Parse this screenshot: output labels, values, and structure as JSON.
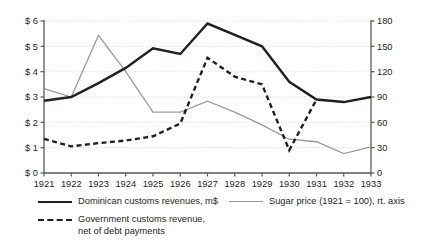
{
  "chart_data": {
    "type": "line",
    "title": "",
    "subtitle": "",
    "xlabel": "",
    "ylabel": "",
    "y2label": "",
    "grid": true,
    "legend_position": "bottom",
    "x": [
      "1921",
      "1922",
      "1923",
      "1924",
      "1925",
      "1926",
      "1927",
      "1928",
      "1929",
      "1930",
      "1931",
      "1932",
      "1933"
    ],
    "xtick_labels": [
      "1921",
      "1922",
      "1923",
      "1924",
      "1925",
      "1926",
      "1927",
      "1928",
      "1929",
      "1930",
      "1931",
      "1932",
      "1933"
    ],
    "ylim": [
      0,
      6
    ],
    "ytick_labels": [
      "$ 0",
      "$ 1",
      "$ 2",
      "$ 3",
      "$ 4",
      "$ 5",
      "$ 6"
    ],
    "ytick_values": [
      0,
      1,
      2,
      3,
      4,
      5,
      6
    ],
    "y2lim": [
      0,
      180
    ],
    "y2tick_labels": [
      "0",
      "30",
      "60",
      "90",
      "120",
      "150",
      "180"
    ],
    "y2tick_values": [
      0,
      30,
      60,
      90,
      120,
      150,
      180
    ],
    "series": [
      {
        "name": "Dominican customs revenues, m$",
        "axis": "left",
        "style": "solid",
        "color": "#231f20",
        "width": 2.4,
        "values": [
          2.85,
          3.0,
          3.55,
          4.15,
          4.92,
          4.7,
          5.9,
          5.45,
          5.0,
          3.6,
          2.9,
          2.8,
          3.0
        ]
      },
      {
        "name": "Government customs revenue, net of debt payments",
        "axis": "left",
        "style": "dashed",
        "color": "#231f20",
        "width": 2.4,
        "values": [
          1.35,
          1.05,
          1.18,
          1.28,
          1.45,
          1.95,
          4.55,
          3.8,
          3.5,
          0.9,
          2.9,
          null,
          null
        ]
      },
      {
        "name": "Sugar price (1921 = 100), rt. axis",
        "axis": "right",
        "style": "solid",
        "color": "#9a9a9a",
        "width": 1.3,
        "values": [
          100,
          90,
          163,
          120,
          72,
          72,
          85,
          72,
          57,
          40,
          37,
          23,
          31
        ]
      }
    ]
  },
  "legend": {
    "items": [
      {
        "label": "Dominican customs revenues, m$",
        "swatch": "solid-dark"
      },
      {
        "label": "Sugar price (1921 = 100), rt. axis",
        "swatch": "solid-gray"
      },
      {
        "label": "Government customs revenue,",
        "label2": "net of debt payments",
        "swatch": "dash"
      }
    ]
  },
  "colors": {
    "axis": "#58595b",
    "grid": "#c9c9c9",
    "dark_series": "#231f20",
    "gray_series": "#9a9a9a",
    "text": "#231f20"
  }
}
